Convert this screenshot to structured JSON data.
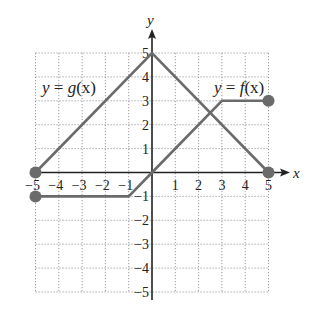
{
  "chart_data": {
    "type": "line",
    "title": "",
    "xlabel": "x",
    "ylabel": "y",
    "xlim": [
      -5,
      5
    ],
    "ylim": [
      -5,
      5
    ],
    "grid": true,
    "x_ticks": [
      -5,
      -4,
      -3,
      -2,
      -1,
      1,
      2,
      3,
      4,
      5
    ],
    "y_ticks": [
      5,
      4,
      3,
      2,
      1,
      -1,
      -2,
      -3,
      -4,
      -5
    ],
    "x_tick_labels": [
      "−5",
      "−4",
      "−3",
      "−2",
      "−1",
      "1",
      "2",
      "3",
      "4",
      "5"
    ],
    "y_tick_labels": [
      "5",
      "4",
      "3",
      "2",
      "1",
      "−1",
      "−2",
      "−3",
      "−4",
      "−5"
    ],
    "series": [
      {
        "name": "y = g(x)",
        "points": [
          [
            -5,
            0
          ],
          [
            0,
            5
          ],
          [
            5,
            0
          ]
        ],
        "endpoints": [
          [
            -5,
            0
          ],
          [
            5,
            0
          ]
        ],
        "color": "#6b6b6b"
      },
      {
        "name": "y = f(x)",
        "points": [
          [
            -5,
            -1
          ],
          [
            -1,
            -1
          ],
          [
            0,
            0
          ],
          [
            3,
            3
          ],
          [
            5,
            3
          ]
        ],
        "endpoints": [
          [
            -5,
            -1
          ],
          [
            5,
            3
          ]
        ],
        "color": "#6b6b6b"
      }
    ],
    "annotations": [
      {
        "text": "y = g(x)",
        "near": [
          -4,
          3.6
        ]
      },
      {
        "text": "y = f(x)",
        "near": [
          3.2,
          3.6
        ]
      }
    ]
  },
  "labels": {
    "x_axis": "x",
    "y_axis": "y",
    "g_label_prefix": "y",
    "g_label_eq": " = ",
    "g_label_fn": "g",
    "g_label_arg": "(x)",
    "f_label_prefix": "y",
    "f_label_eq": " = ",
    "f_label_fn": "f",
    "f_label_arg": "(x)"
  },
  "colors": {
    "curve": "#6b6b6b",
    "axis": "#222222",
    "grid": "#9a9a9a"
  }
}
